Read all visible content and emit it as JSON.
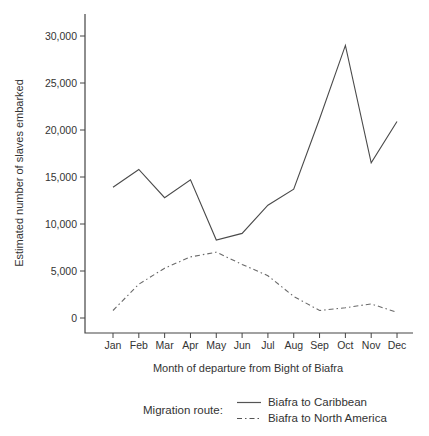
{
  "chart_data": {
    "type": "line",
    "title": "",
    "xlabel": "Month of departure from Bight of Biafra",
    "ylabel": "Estimated number of slaves embarked",
    "categories": [
      "Jan",
      "Feb",
      "Mar",
      "Apr",
      "May",
      "Jun",
      "Jul",
      "Aug",
      "Sep",
      "Oct",
      "Nov",
      "Dec"
    ],
    "yticks": [
      "0",
      "5,000",
      "10,000",
      "15,000",
      "20,000",
      "25,000",
      "30,000"
    ],
    "ylim": [
      0,
      31500
    ],
    "grid": false,
    "legend_position": "bottom",
    "series": [
      {
        "name": "Biafra to Caribbean",
        "line_style": "solid",
        "color": "#4a4a4a",
        "values": [
          13900,
          15800,
          12800,
          14700,
          8300,
          9000,
          12000,
          13700,
          21200,
          29000,
          16500,
          20900
        ]
      },
      {
        "name": "Biafra to North America",
        "line_style": "dash-dot",
        "color": "#6a6a6a",
        "values": [
          800,
          3600,
          5300,
          6500,
          7000,
          5700,
          4500,
          2300,
          800,
          1100,
          1500,
          600
        ]
      }
    ]
  },
  "legend": {
    "title": "Migration route:",
    "items": [
      {
        "label": "Biafra to Caribbean",
        "style": "solid"
      },
      {
        "label": "Biafra to North America",
        "style": "dash-dot"
      }
    ]
  },
  "colors": {
    "axis": "#444444",
    "text": "#333333",
    "background": "#ffffff"
  }
}
